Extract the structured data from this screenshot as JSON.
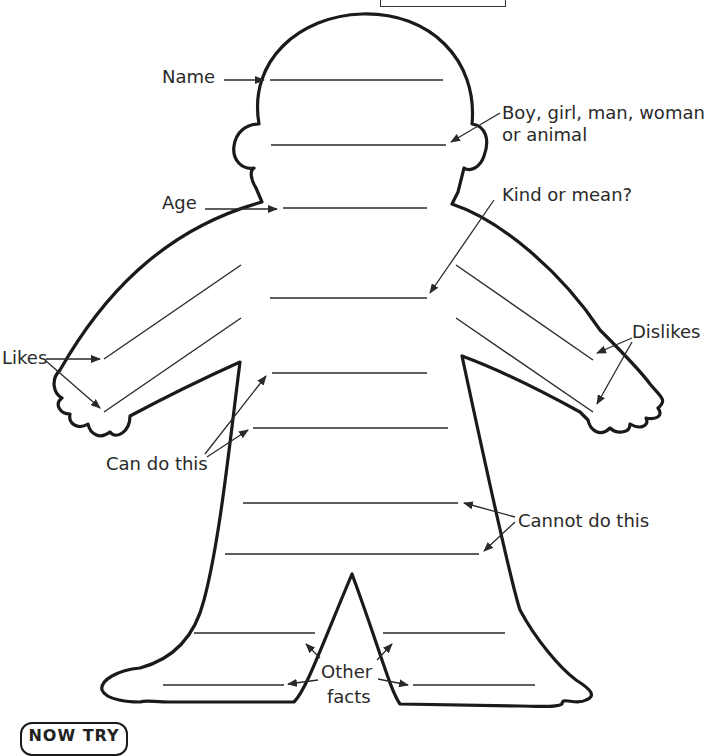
{
  "worksheet": {
    "labels": {
      "name": "Name",
      "identity_line1": "Boy, girl, man, woman",
      "identity_line2": "or animal",
      "age": "Age",
      "kind_or_mean": "Kind or mean?",
      "likes": "Likes",
      "dislikes": "Dislikes",
      "can_do": "Can do this",
      "cannot_do": "Cannot do this",
      "other_line1": "Other",
      "other_line2": "facts"
    },
    "badge": "NOW TRY",
    "colors": {
      "ink": "#1a1a1a",
      "paper": "#ffffff"
    }
  }
}
